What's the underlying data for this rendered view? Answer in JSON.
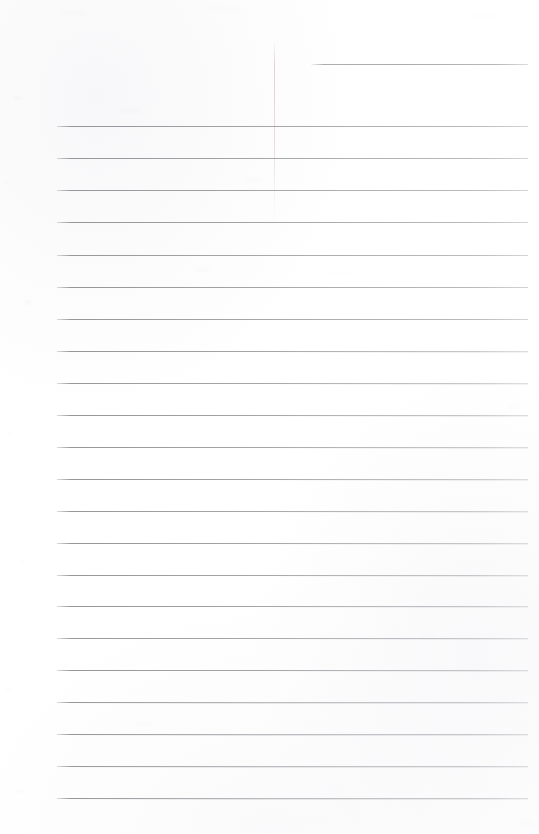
{
  "document": {
    "kind": "scanned-page",
    "title": "Blank Lined Notebook Page",
    "page_width": 539,
    "page_height": 834,
    "background_color": "#ffffff",
    "rule_color": "#96969b",
    "margin_rule_color": "#e1d0d5",
    "text_content": "",
    "handwriting_present": "no",
    "typed_text_present": "no"
  },
  "ruling": {
    "line_count": 23,
    "line_spacing_px": 32.1,
    "line_thickness_px": 1,
    "content_left_px": 57,
    "content_right_px": 528,
    "first_line_is_partial": "yes",
    "partial_line_left_px": 311,
    "lines": [
      {
        "index": 1,
        "y": 64,
        "left": 311,
        "right": 528,
        "partial": true,
        "opacity": 0.92
      },
      {
        "index": 2,
        "y": 126,
        "left": 57,
        "right": 528,
        "partial": false,
        "opacity": 0.95
      },
      {
        "index": 3,
        "y": 158,
        "left": 57,
        "right": 528,
        "partial": false,
        "opacity": 0.95
      },
      {
        "index": 4,
        "y": 190,
        "left": 57,
        "right": 528,
        "partial": false,
        "opacity": 0.94
      },
      {
        "index": 5,
        "y": 222,
        "left": 57,
        "right": 528,
        "partial": false,
        "opacity": 0.95
      },
      {
        "index": 6,
        "y": 255,
        "left": 57,
        "right": 528,
        "partial": false,
        "opacity": 0.93
      },
      {
        "index": 7,
        "y": 287,
        "left": 57,
        "right": 528,
        "partial": false,
        "opacity": 0.95
      },
      {
        "index": 8,
        "y": 319,
        "left": 57,
        "right": 528,
        "partial": false,
        "opacity": 0.94
      },
      {
        "index": 9,
        "y": 351,
        "left": 57,
        "right": 528,
        "partial": false,
        "opacity": 0.95
      },
      {
        "index": 10,
        "y": 383,
        "left": 57,
        "right": 528,
        "partial": false,
        "opacity": 0.93
      },
      {
        "index": 11,
        "y": 415,
        "left": 57,
        "right": 528,
        "partial": false,
        "opacity": 0.95
      },
      {
        "index": 12,
        "y": 447,
        "left": 57,
        "right": 528,
        "partial": false,
        "opacity": 0.94
      },
      {
        "index": 13,
        "y": 479,
        "left": 57,
        "right": 528,
        "partial": false,
        "opacity": 0.95
      },
      {
        "index": 14,
        "y": 511,
        "left": 57,
        "right": 528,
        "partial": false,
        "opacity": 0.93
      },
      {
        "index": 15,
        "y": 543,
        "left": 57,
        "right": 528,
        "partial": false,
        "opacity": 0.95
      },
      {
        "index": 16,
        "y": 575,
        "left": 57,
        "right": 528,
        "partial": false,
        "opacity": 0.94
      },
      {
        "index": 17,
        "y": 606,
        "left": 57,
        "right": 528,
        "partial": false,
        "opacity": 0.95
      },
      {
        "index": 18,
        "y": 638,
        "left": 57,
        "right": 528,
        "partial": false,
        "opacity": 0.93
      },
      {
        "index": 19,
        "y": 670,
        "left": 57,
        "right": 528,
        "partial": false,
        "opacity": 0.95
      },
      {
        "index": 20,
        "y": 702,
        "left": 57,
        "right": 528,
        "partial": false,
        "opacity": 0.94
      },
      {
        "index": 21,
        "y": 734,
        "left": 57,
        "right": 528,
        "partial": false,
        "opacity": 0.95
      },
      {
        "index": 22,
        "y": 766,
        "left": 57,
        "right": 528,
        "partial": false,
        "opacity": 0.93
      },
      {
        "index": 23,
        "y": 798,
        "left": 57,
        "right": 528,
        "partial": false,
        "opacity": 0.95
      }
    ]
  },
  "margin_rule": {
    "x": 274,
    "top": 40,
    "height": 185,
    "visible": "faint"
  },
  "speckles": [
    {
      "x": 14,
      "y": 96,
      "w": 7,
      "h": 4,
      "o": 0.05
    },
    {
      "x": 3,
      "y": 180,
      "w": 5,
      "h": 3,
      "o": 0.04
    },
    {
      "x": 25,
      "y": 300,
      "w": 6,
      "h": 5,
      "o": 0.05
    },
    {
      "x": 8,
      "y": 432,
      "w": 4,
      "h": 4,
      "o": 0.04
    },
    {
      "x": 19,
      "y": 560,
      "w": 6,
      "h": 3,
      "o": 0.045
    },
    {
      "x": 6,
      "y": 688,
      "w": 5,
      "h": 4,
      "o": 0.04
    },
    {
      "x": 16,
      "y": 790,
      "w": 7,
      "h": 3,
      "o": 0.05
    },
    {
      "x": 120,
      "y": 108,
      "w": 22,
      "h": 5,
      "o": 0.035
    },
    {
      "x": 245,
      "y": 178,
      "w": 16,
      "h": 4,
      "o": 0.035
    },
    {
      "x": 330,
      "y": 272,
      "w": 20,
      "h": 4,
      "o": 0.03
    },
    {
      "x": 196,
      "y": 268,
      "w": 14,
      "h": 4,
      "o": 0.035
    },
    {
      "x": 508,
      "y": 404,
      "w": 12,
      "h": 5,
      "o": 0.03
    },
    {
      "x": 135,
      "y": 722,
      "w": 18,
      "h": 4,
      "o": 0.035
    },
    {
      "x": 420,
      "y": 636,
      "w": 15,
      "h": 4,
      "o": 0.03
    },
    {
      "x": 60,
      "y": 10,
      "w": 26,
      "h": 6,
      "o": 0.03
    },
    {
      "x": 210,
      "y": 6,
      "w": 30,
      "h": 6,
      "o": 0.03
    },
    {
      "x": 470,
      "y": 14,
      "w": 24,
      "h": 5,
      "o": 0.03
    },
    {
      "x": 520,
      "y": 820,
      "w": 14,
      "h": 6,
      "o": 0.03
    }
  ]
}
